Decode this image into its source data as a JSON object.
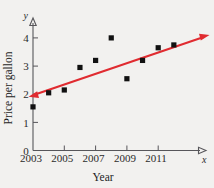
{
  "chart_data": {
    "type": "scatter",
    "title": "",
    "xlabel": "Year",
    "ylabel": "Price per gallon",
    "x_axis_variable": "x",
    "y_axis_variable": "y",
    "xlim": [
      2003,
      2012.8
    ],
    "ylim": [
      0,
      4.6
    ],
    "grid": false,
    "legend": null,
    "x_tick_labels": [
      "2003",
      "2005",
      "2007",
      "2009",
      "2011"
    ],
    "x_tick_values": [
      2003,
      2005,
      2007,
      2009,
      2011
    ],
    "x_minor_tick_values": [
      2004,
      2006,
      2008,
      2010,
      2012
    ],
    "y_tick_labels": [
      "0",
      "1",
      "2",
      "3",
      "4"
    ],
    "y_tick_values": [
      0,
      1,
      2,
      3,
      4
    ],
    "series": [
      {
        "name": "Price per gallon",
        "marker": "square",
        "color": "#111111",
        "x": [
          2003,
          2004,
          2005,
          2006,
          2007,
          2008,
          2009,
          2010,
          2011,
          2012
        ],
        "values": [
          1.55,
          2.05,
          2.15,
          2.95,
          3.2,
          4.0,
          2.55,
          3.2,
          3.65,
          3.75
        ]
      }
    ],
    "trend_line": {
      "name": "line of best fit",
      "color": "#e02b30",
      "arrowheads": "both",
      "x_start": 2002.85,
      "y_start": 1.95,
      "x_end": 2012.9,
      "y_end": 4.05
    }
  }
}
